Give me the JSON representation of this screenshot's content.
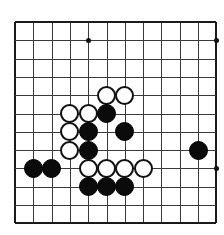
{
  "app": {
    "title": "Go Board Diagram",
    "kind": "go-board-position"
  },
  "board": {
    "type": "go",
    "columns": 12,
    "rows": 12,
    "cell_size": 18.3,
    "origin_x": 15,
    "origin_y": 22,
    "stone_diameter": 19,
    "line_color": "#3a3a3a",
    "edge_color": "#1a1a1a",
    "background_color": "#ffffff",
    "black_color": "#0b0b0b",
    "white_color": "#ffffff",
    "star_points": [
      {
        "col": 4,
        "row": 1
      },
      {
        "col": 11,
        "row": 1
      },
      {
        "col": 11,
        "row": 8
      }
    ],
    "stones": [
      {
        "color": "white",
        "col": 5,
        "row": 4
      },
      {
        "color": "white",
        "col": 6,
        "row": 4
      },
      {
        "color": "white",
        "col": 3,
        "row": 5
      },
      {
        "color": "white",
        "col": 4,
        "row": 5
      },
      {
        "color": "black",
        "col": 5,
        "row": 5
      },
      {
        "color": "white",
        "col": 3,
        "row": 6
      },
      {
        "color": "black",
        "col": 4,
        "row": 6
      },
      {
        "color": "black",
        "col": 6,
        "row": 6
      },
      {
        "color": "white",
        "col": 3,
        "row": 7
      },
      {
        "color": "black",
        "col": 4,
        "row": 7
      },
      {
        "color": "black",
        "col": 10,
        "row": 7
      },
      {
        "color": "black",
        "col": 1,
        "row": 8
      },
      {
        "color": "black",
        "col": 2,
        "row": 8
      },
      {
        "color": "white",
        "col": 4,
        "row": 8
      },
      {
        "color": "white",
        "col": 5,
        "row": 8
      },
      {
        "color": "white",
        "col": 6,
        "row": 8
      },
      {
        "color": "white",
        "col": 7,
        "row": 8
      },
      {
        "color": "black",
        "col": 4,
        "row": 9
      },
      {
        "color": "black",
        "col": 5,
        "row": 9
      },
      {
        "color": "black",
        "col": 6,
        "row": 9
      }
    ],
    "counts": {
      "black_stones": 10,
      "white_stones": 10,
      "total_stones": 20
    }
  }
}
